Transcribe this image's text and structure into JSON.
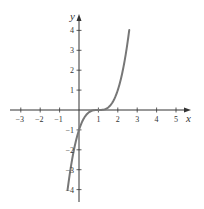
{
  "chart_data": {
    "type": "line",
    "title": "",
    "xlabel": "x",
    "ylabel": "y",
    "xlim": [
      -3.5,
      5.7
    ],
    "ylim": [
      -4.5,
      4.8
    ],
    "x_ticks": [
      -3,
      -2,
      -1,
      1,
      2,
      3,
      4,
      5
    ],
    "y_ticks": [
      -4,
      -3,
      -2,
      -1,
      1,
      2,
      3,
      4
    ],
    "x_tick_labels": [
      "−3",
      "−2",
      "−1",
      "1",
      "2",
      "3",
      "4",
      "5"
    ],
    "y_tick_labels": [
      "−4",
      "−3",
      "−2",
      "−1",
      "1",
      "2",
      "3",
      "4"
    ],
    "grid": false,
    "legend": null,
    "series": [
      {
        "name": "y = (x − 1)^3",
        "x": [
          -0.59,
          -0.4,
          -0.2,
          0,
          0.2,
          0.4,
          0.6,
          0.8,
          1.0,
          1.2,
          1.4,
          1.6,
          1.8,
          2.0,
          2.2,
          2.4,
          2.59
        ],
        "y": [
          -4.0,
          -2.74,
          -1.73,
          -1.0,
          -0.51,
          -0.22,
          -0.06,
          -0.01,
          0.0,
          0.01,
          0.06,
          0.22,
          0.51,
          1.0,
          1.73,
          2.74,
          4.0
        ],
        "color": "#777777"
      }
    ],
    "axis_color": "#333333"
  }
}
